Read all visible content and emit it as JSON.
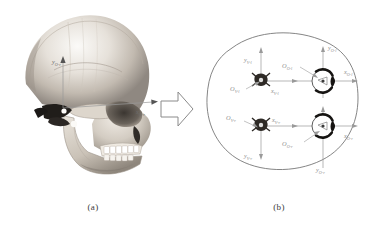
{
  "figure": {
    "panel_a": {
      "caption": "(a)",
      "image_name": "human-skull-lateral-photograph",
      "axis_labels": {
        "x_axis": "x",
        "x_axis_sub": "O-r",
        "y_axis": "y",
        "y_axis_sub": "O-r"
      }
    },
    "transition": {
      "icon": "block-arrow-right-icon"
    },
    "panel_b": {
      "caption": "(b)",
      "outline_name": "head-top-view-outline",
      "coordinate_systems": [
        {
          "id": "vertebra-left",
          "origin_label": "O",
          "origin_sub": "V-l",
          "x_label": "x",
          "x_sub": "V-l",
          "y_label": "y",
          "y_sub": "V-l",
          "marker": "vertebra-marker-left"
        },
        {
          "id": "orbit-left",
          "origin_label": "O",
          "origin_sub": "O-l",
          "x_label": "x",
          "x_sub": "O-l",
          "y_label": "y",
          "y_sub": "O-l",
          "marker": "orbit-ring-left"
        },
        {
          "id": "vertebra-right",
          "origin_label": "O",
          "origin_sub": "V-r",
          "x_label": "x",
          "x_sub": "V-r",
          "y_label": "y",
          "y_sub": "V-r",
          "marker": "vertebra-marker-right"
        },
        {
          "id": "orbit-right",
          "origin_label": "O",
          "origin_sub": "O-r",
          "x_label": "x",
          "x_sub": "O-r",
          "y_label": "y",
          "y_sub": "O-r",
          "marker": "orbit-ring-right"
        }
      ]
    },
    "colors": {
      "background": "#ffffff",
      "label_gray": "#8e8e8e",
      "axis_gray": "#9a9a9a",
      "outline_gray": "#6f6f6f",
      "caption_gray": "#3a3a3a",
      "bone_light": "#f2efea",
      "bone_mid": "#c9c3bb",
      "bone_dark": "#8a8178",
      "shadow_dark": "#2b2724"
    }
  }
}
